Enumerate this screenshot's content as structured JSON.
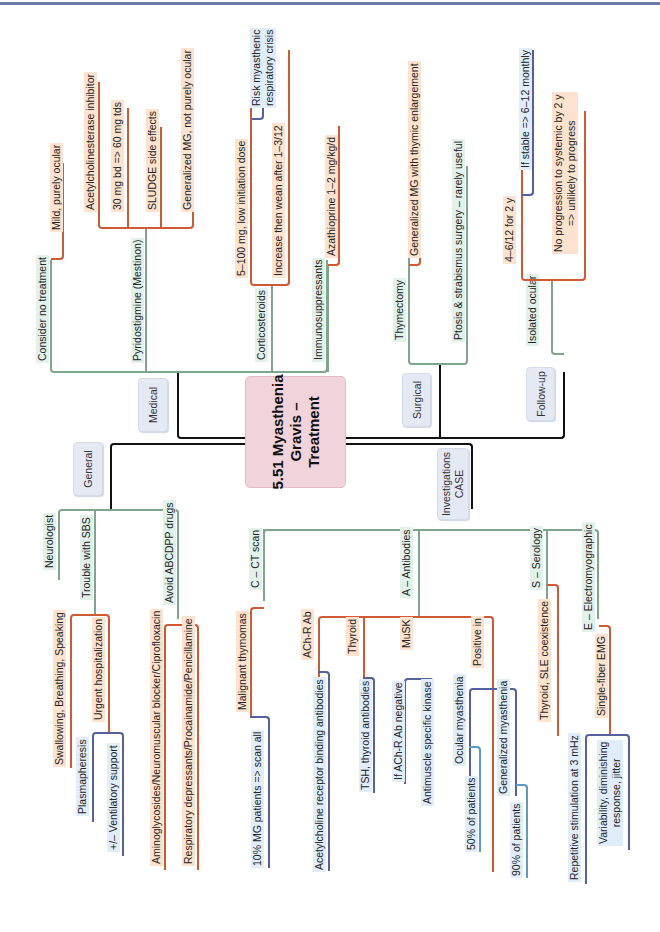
{
  "title": "5.51 Myasthenia\nGravis –\nTreatment",
  "colors": {
    "trunk": "#111111",
    "level1": "#7fa68a",
    "level2": "#cf5a33",
    "level3": "#55609e",
    "level4": "#5a9bcc",
    "center_fill": "#f0d3db",
    "category_fill": "#e4e9f3",
    "green_label_bg": "#e2f1ea",
    "orange_label_bg": "#fbe3cf",
    "blue_label_bg": "#e1eefa"
  },
  "branches": {
    "medical": {
      "label": "Medical",
      "items": {
        "consider_no_treatment": {
          "label": "Consider no treatment",
          "children": {
            "mild": "Mild, purely ocular"
          }
        },
        "pyridostigmine": {
          "label": "Pyridostigmine (Mestinon)",
          "children": {
            "ache_inhibitor": "Acetylcholinesterase inhibitor",
            "dose": "30 mg bd => 60 mg tds",
            "sludge": "SLUDGE side effects",
            "generalized": "Generalized MG, not purely ocular"
          }
        },
        "corticosteroids": {
          "label": "Corticosteroids",
          "children": {
            "initiation": "5–100 mg, low initiation dose",
            "risk": "Risk myasthenic\nrespiratory crisis",
            "wean": "Increase then wean after 1–3/12"
          }
        },
        "immunosuppressants": {
          "label": "Immunosuppressants",
          "children": {
            "azathioprine": "Azathioprine 1–2 mg/kg/d"
          }
        }
      }
    },
    "surgical": {
      "label": "Surgical",
      "items": {
        "thymectomy": {
          "label": "Thymectomy",
          "children": {
            "generalized_thymic": "Generalized MG with thymic enlargement"
          }
        },
        "ptosis": {
          "label": "Ptosis & strabismus surgery – rarely useful"
        }
      }
    },
    "follow_up": {
      "label": "Follow-up",
      "items": {
        "isolated_ocular": {
          "label": "Isolated ocular",
          "children": {
            "interval": "4–6/12 for 2 y",
            "if_stable": "If stable => 6–12 monthly",
            "no_progression": "No progression to systemic by 2 y\n=> unlikely to progress"
          }
        }
      }
    },
    "general": {
      "label": "General",
      "items": {
        "neurologist": {
          "label": "Neurologist"
        },
        "trouble_sbs": {
          "label": "Trouble with SBS",
          "children": {
            "sbs": "Swallowing, Breathing, Speaking",
            "urgent": "Urgent hospitalization",
            "plasmapheresis": "Plasmapheresis",
            "ventilatory": "+/– Ventilatory support"
          }
        },
        "avoid_drugs": {
          "label": "Avoid ABCDPP drugs",
          "children": {
            "aminoglycosides": "Aminoglycosides/Neuromuscular blocker/Ciprofloxacin",
            "respiratory": "Respiratory depressants/Procainamide/Penicillamine"
          }
        }
      }
    },
    "investigations": {
      "label": "Investigations\nCASE",
      "items": {
        "ct_scan": {
          "label": "C – CT scan",
          "children": {
            "thymomas": "Malignant thymomas",
            "scan_all": "10% MG patients => scan all"
          }
        },
        "antibodies": {
          "label": "A – Antibodies",
          "children": {
            "achr": "ACh-R Ab",
            "achr_desc": "Acetylcholine receptor binding antibodies",
            "thyroid": "Thyroid",
            "thyroid_desc": "TSH, thyroid antibodies",
            "musk": "MuSK",
            "musk_cond": "If ACh-R Ab negative",
            "musk_desc": "Antimuscle specific kinase",
            "positive_in": "Positive in",
            "ocular": "Ocular myasthenia",
            "ocular_pct": "50% of patients",
            "generalized": "Generalized myasthenia",
            "generalized_pct": "90% of patients"
          }
        },
        "serology": {
          "label": "S – Serology",
          "children": {
            "coexistence": "Thyroid, SLE coexistence"
          }
        },
        "emg": {
          "label": "E – Electromyographic",
          "children": {
            "single_fiber": "Single-fiber EMG",
            "repetitive": "Repetitive stimulation at 3 mHz",
            "variability": "Variability, diminishing\nresponse, jitter"
          }
        }
      }
    }
  }
}
